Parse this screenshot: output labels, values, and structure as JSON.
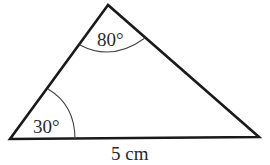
{
  "diagram": {
    "type": "triangle",
    "vertices": {
      "top": {
        "x": 108,
        "y": 5
      },
      "bottom_left": {
        "x": 10,
        "y": 139
      },
      "bottom_right": {
        "x": 259,
        "y": 137
      }
    },
    "angles": {
      "top": "80°",
      "bottom_left": "30°"
    },
    "sides": {
      "base": "5 cm"
    },
    "colors": {
      "stroke": "#1a1a1a",
      "arc": "#444444",
      "text": "#2a2a2a"
    }
  }
}
